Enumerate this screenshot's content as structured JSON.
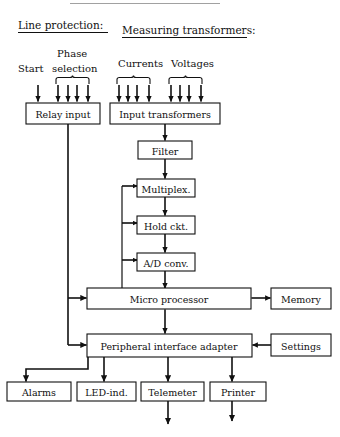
{
  "diagram": {
    "headings": [
      {
        "id": "line-protection",
        "text": "Line protection:"
      },
      {
        "id": "measuring-transformers",
        "text": "Measuring transformers:"
      }
    ],
    "input_sources": [
      {
        "id": "start",
        "label": "Start",
        "arrows": 1,
        "brace": false
      },
      {
        "id": "phase-selection",
        "label_line1": "Phase",
        "label_line2": "selection",
        "arrows": 4,
        "brace": true
      },
      {
        "id": "currents",
        "label": "Currents",
        "arrows": 4,
        "brace": true
      },
      {
        "id": "voltages",
        "label": "Voltages",
        "arrows": 4,
        "brace": true
      }
    ],
    "blocks": [
      {
        "id": "relay-input",
        "label": "Relay input"
      },
      {
        "id": "input-transformers",
        "label": "Input transformers"
      },
      {
        "id": "filter",
        "label": "Filter"
      },
      {
        "id": "multiplexer",
        "label": "Multiplex."
      },
      {
        "id": "hold-circuit",
        "label": "Hold ckt."
      },
      {
        "id": "ad-converter",
        "label": "A/D conv."
      },
      {
        "id": "micro-processor",
        "label": "Micro processor"
      },
      {
        "id": "memory",
        "label": "Memory"
      },
      {
        "id": "peripheral-interface-adapter",
        "label": "Peripheral interface adapter"
      },
      {
        "id": "settings",
        "label": "Settings"
      },
      {
        "id": "alarms",
        "label": "Alarms"
      },
      {
        "id": "led-indicator",
        "label": "LED-ind."
      },
      {
        "id": "telemeter",
        "label": "Telemeter"
      },
      {
        "id": "printer",
        "label": "Printer"
      }
    ],
    "connections": [
      {
        "from": "input-transformers",
        "to": "filter",
        "type": "arrow"
      },
      {
        "from": "filter",
        "to": "multiplexer",
        "type": "arrow"
      },
      {
        "from": "multiplexer",
        "to": "hold-circuit",
        "type": "arrow"
      },
      {
        "from": "hold-circuit",
        "to": "ad-converter",
        "type": "arrow"
      },
      {
        "from": "ad-converter",
        "to": "micro-processor",
        "type": "arrow"
      },
      {
        "from": "micro-processor",
        "to": "multiplexer",
        "type": "control-arrow"
      },
      {
        "from": "micro-processor",
        "to": "hold-circuit",
        "type": "control-arrow"
      },
      {
        "from": "micro-processor",
        "to": "ad-converter",
        "type": "control-arrow"
      },
      {
        "from": "relay-input",
        "to": "micro-processor",
        "type": "arrow"
      },
      {
        "from": "relay-input",
        "to": "peripheral-interface-adapter",
        "type": "arrow"
      },
      {
        "from": "micro-processor",
        "to": "memory",
        "type": "double-arrow"
      },
      {
        "from": "micro-processor",
        "to": "peripheral-interface-adapter",
        "type": "double-arrow"
      },
      {
        "from": "settings",
        "to": "peripheral-interface-adapter",
        "type": "arrow"
      },
      {
        "from": "peripheral-interface-adapter",
        "to": "alarms",
        "type": "arrow"
      },
      {
        "from": "peripheral-interface-adapter",
        "to": "led-indicator",
        "type": "arrow"
      },
      {
        "from": "peripheral-interface-adapter",
        "to": "telemeter",
        "type": "arrow"
      },
      {
        "from": "peripheral-interface-adapter",
        "to": "printer",
        "type": "arrow"
      },
      {
        "from": "telemeter",
        "to": "external-output",
        "type": "arrow"
      },
      {
        "from": "printer",
        "to": "external-output",
        "type": "arrow"
      }
    ],
    "colors": {
      "ink": "#111111",
      "paper": "#ffffff"
    }
  }
}
